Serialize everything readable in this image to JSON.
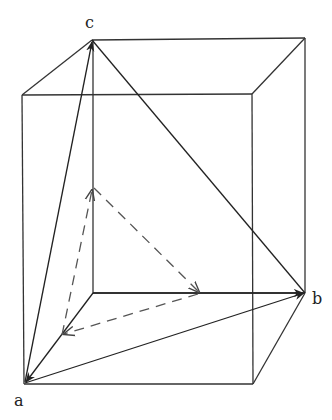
{
  "diagram": {
    "type": "3d-box-vectors",
    "labels": {
      "a": "a",
      "b": "b",
      "c": "c"
    },
    "colors": {
      "line": "#333333",
      "background": "#ffffff"
    },
    "solid_vectors": [
      "a→b",
      "a→c",
      "c→b (edge)",
      "(93,293)→b",
      "(93,293)→a"
    ],
    "dashed_vectors": [
      "to midpoint of back-left edge",
      "to midpoint on bottom back edge"
    ]
  }
}
